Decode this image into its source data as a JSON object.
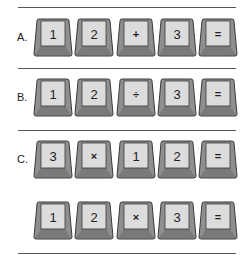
{
  "colors": {
    "key_face": "#dcdcdc",
    "key_side": "#8f8f8f",
    "key_bottom": "#7a7a7a",
    "key_outline": "#3a3a3a",
    "rule": "#555555"
  },
  "rows": [
    {
      "label": "A.",
      "keys": [
        {
          "label": "1",
          "type": "digit"
        },
        {
          "label": "2",
          "type": "digit"
        },
        {
          "label": "+",
          "type": "operator"
        },
        {
          "label": "3",
          "type": "digit"
        },
        {
          "label": "=",
          "type": "operator"
        }
      ]
    },
    {
      "label": "B.",
      "keys": [
        {
          "label": "1",
          "type": "digit"
        },
        {
          "label": "2",
          "type": "digit"
        },
        {
          "label": "÷",
          "type": "operator"
        },
        {
          "label": "3",
          "type": "digit"
        },
        {
          "label": "=",
          "type": "operator"
        }
      ]
    },
    {
      "label": "C.",
      "keys": [
        {
          "label": "3",
          "type": "digit"
        },
        {
          "label": "×",
          "type": "operator"
        },
        {
          "label": "1",
          "type": "digit"
        },
        {
          "label": "2",
          "type": "digit"
        },
        {
          "label": "=",
          "type": "operator"
        }
      ]
    },
    {
      "label": "",
      "keys": [
        {
          "label": "1",
          "type": "digit"
        },
        {
          "label": "2",
          "type": "digit"
        },
        {
          "label": "×",
          "type": "operator"
        },
        {
          "label": "3",
          "type": "digit"
        },
        {
          "label": "=",
          "type": "operator"
        }
      ]
    }
  ]
}
